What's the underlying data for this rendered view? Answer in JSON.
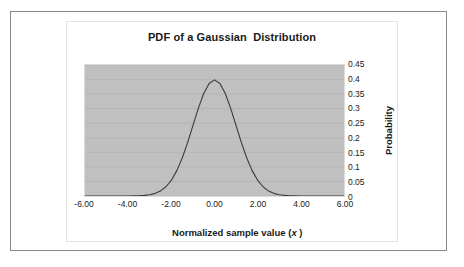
{
  "chart_data": {
    "type": "line",
    "title": "PDF of a Gaussian  Distribution",
    "xlabel_prefix": "Normalized sample value (",
    "xlabel_variable": "x",
    "xlabel_suffix": " )",
    "xlabel_full": "Normalized sample value (x )",
    "ylabel": "Probability",
    "xlim": [
      -6,
      6
    ],
    "ylim": [
      0,
      0.45
    ],
    "xticks": [
      "-6.00",
      "-4.00",
      "-2.00",
      "0.00",
      "2.00",
      "4.00",
      "6.00"
    ],
    "xtick_values": [
      -6,
      -4,
      -2,
      0,
      2,
      4,
      6
    ],
    "yticks": [
      "0",
      "0.05",
      "0.1",
      "0.15",
      "0.2",
      "0.25",
      "0.3",
      "0.35",
      "0.4",
      "0.45"
    ],
    "ytick_values": [
      0,
      0.05,
      0.1,
      0.15,
      0.2,
      0.25,
      0.3,
      0.35,
      0.4,
      0.45
    ],
    "grid": true,
    "grid_axis": "y",
    "legend": false,
    "plot_background": "#c0c0c0",
    "line_color": "#3a3a3a",
    "series": [
      {
        "name": "Gaussian PDF",
        "distribution": "normal",
        "mean": 0,
        "stddev": 1,
        "peak_value": 0.3989,
        "x": [
          -6.0,
          -5.75,
          -5.5,
          -5.25,
          -5.0,
          -4.75,
          -4.5,
          -4.25,
          -4.0,
          -3.75,
          -3.5,
          -3.25,
          -3.0,
          -2.75,
          -2.5,
          -2.25,
          -2.0,
          -1.75,
          -1.5,
          -1.25,
          -1.0,
          -0.75,
          -0.5,
          -0.25,
          0.0,
          0.25,
          0.5,
          0.75,
          1.0,
          1.25,
          1.5,
          1.75,
          2.0,
          2.25,
          2.5,
          2.75,
          3.0,
          3.25,
          3.5,
          3.75,
          4.0,
          4.25,
          4.5,
          4.75,
          5.0,
          5.25,
          5.5,
          5.75,
          6.0
        ],
        "y": [
          0.0,
          0.0,
          0.0,
          0.0,
          0.0,
          0.0,
          0.0,
          0.0001,
          0.0001,
          0.0004,
          0.0009,
          0.002,
          0.0044,
          0.0091,
          0.0175,
          0.0317,
          0.054,
          0.0863,
          0.1295,
          0.1826,
          0.242,
          0.3011,
          0.3521,
          0.3867,
          0.3989,
          0.3867,
          0.3521,
          0.3011,
          0.242,
          0.1826,
          0.1295,
          0.0863,
          0.054,
          0.0317,
          0.0175,
          0.0091,
          0.0044,
          0.002,
          0.0009,
          0.0004,
          0.0001,
          0.0001,
          0.0,
          0.0,
          0.0,
          0.0,
          0.0,
          0.0,
          0.0
        ]
      }
    ]
  }
}
